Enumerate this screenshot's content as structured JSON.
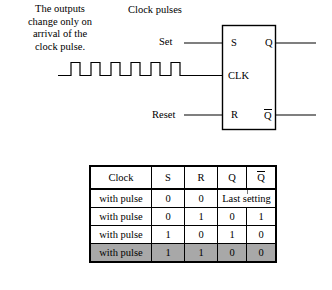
{
  "note": {
    "lines": [
      "The outputs",
      "change only on",
      "arrival of the",
      "clock pulse."
    ],
    "text": "The outputs change only on arrival of the clock pulse."
  },
  "clock_caption": "Clock pulses",
  "schematic": {
    "type": "clocked-sr-flip-flop",
    "inputs": [
      {
        "name": "set-input",
        "label": "Set",
        "pin": "S"
      },
      {
        "name": "clock-input",
        "label": "",
        "pin": "CLK"
      },
      {
        "name": "reset-input",
        "label": "Reset",
        "pin": "R"
      }
    ],
    "outputs": [
      {
        "name": "q-output",
        "pin": "Q",
        "overbar": false
      },
      {
        "name": "qbar-output",
        "pin": "Q",
        "overbar": true
      }
    ],
    "pin_labels": {
      "s": "S",
      "clk": "CLK",
      "r": "R",
      "q": "Q",
      "qbar": "Q"
    },
    "waveform": {
      "name": "clock-pulse-train",
      "pulse_count": 6,
      "style": "square-wave",
      "line_color": "#000000"
    }
  },
  "truth_table": {
    "columns": [
      "Clock",
      "S",
      "R",
      "Q",
      "Q"
    ],
    "column_overbar": [
      false,
      false,
      false,
      false,
      true
    ],
    "rows": [
      {
        "clock": "with pulse",
        "s": "0",
        "r": "0",
        "merged_output": "Last setting",
        "highlight": false
      },
      {
        "clock": "with pulse",
        "s": "0",
        "r": "1",
        "q": "0",
        "qbar": "1",
        "highlight": false
      },
      {
        "clock": "with pulse",
        "s": "1",
        "r": "0",
        "q": "1",
        "qbar": "0",
        "highlight": false
      },
      {
        "clock": "with pulse",
        "s": "1",
        "r": "1",
        "q": "0",
        "qbar": "0",
        "highlight": true
      }
    ],
    "highlight_color": "#a8a8a8"
  },
  "colors": {
    "ink": "#000000",
    "paper": "#ffffff",
    "highlight": "#a8a8a8"
  }
}
